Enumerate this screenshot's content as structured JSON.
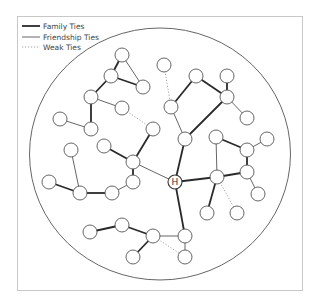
{
  "colors": {
    "frame": "#c8c8c8",
    "boundary": "#555555",
    "family": "#2a2a2a",
    "friendship": "#555555",
    "weak": "#9a9a9a",
    "node_fill": "#ffffff",
    "node_stroke": "#555555"
  },
  "legend": {
    "items": [
      {
        "label": "Family Ties",
        "style": "family"
      },
      {
        "label": "Friendship Ties",
        "style": "friendship"
      },
      {
        "label": "Weak Ties",
        "style": "weak"
      }
    ]
  },
  "center_node": {
    "id": "H",
    "label": "H"
  },
  "nodes": [
    {
      "id": "H",
      "x": 175,
      "y": 182
    },
    {
      "id": "n1",
      "x": 122,
      "y": 55
    },
    {
      "id": "n2",
      "x": 111,
      "y": 76
    },
    {
      "id": "n3",
      "x": 143,
      "y": 87
    },
    {
      "id": "n4",
      "x": 91,
      "y": 97
    },
    {
      "id": "n5",
      "x": 122,
      "y": 108
    },
    {
      "id": "n6",
      "x": 60,
      "y": 119
    },
    {
      "id": "n7",
      "x": 91,
      "y": 129
    },
    {
      "id": "n8",
      "x": 153,
      "y": 129
    },
    {
      "id": "n9",
      "x": 164,
      "y": 65
    },
    {
      "id": "n10",
      "x": 196,
      "y": 76
    },
    {
      "id": "n11",
      "x": 227,
      "y": 76
    },
    {
      "id": "n12",
      "x": 227,
      "y": 97
    },
    {
      "id": "n13",
      "x": 171,
      "y": 107
    },
    {
      "id": "n14",
      "x": 247,
      "y": 118
    },
    {
      "id": "n15",
      "x": 185,
      "y": 139
    },
    {
      "id": "n16",
      "x": 216,
      "y": 137
    },
    {
      "id": "n17",
      "x": 247,
      "y": 150
    },
    {
      "id": "n18",
      "x": 267,
      "y": 139
    },
    {
      "id": "n19",
      "x": 247,
      "y": 172
    },
    {
      "id": "n20",
      "x": 217,
      "y": 177
    },
    {
      "id": "n21",
      "x": 258,
      "y": 194
    },
    {
      "id": "n22",
      "x": 207,
      "y": 213
    },
    {
      "id": "n23",
      "x": 237,
      "y": 213
    },
    {
      "id": "n24",
      "x": 71,
      "y": 150
    },
    {
      "id": "n25",
      "x": 104,
      "y": 146
    },
    {
      "id": "n26",
      "x": 133,
      "y": 162
    },
    {
      "id": "n27",
      "x": 49,
      "y": 182
    },
    {
      "id": "n28",
      "x": 133,
      "y": 182
    },
    {
      "id": "n29",
      "x": 80,
      "y": 193
    },
    {
      "id": "n30",
      "x": 112,
      "y": 193
    },
    {
      "id": "n31",
      "x": 90,
      "y": 232
    },
    {
      "id": "n32",
      "x": 122,
      "y": 225
    },
    {
      "id": "n33",
      "x": 153,
      "y": 236
    },
    {
      "id": "n34",
      "x": 185,
      "y": 236
    },
    {
      "id": "n35",
      "x": 133,
      "y": 257
    },
    {
      "id": "n36",
      "x": 185,
      "y": 257
    }
  ],
  "edges": [
    {
      "from": "n1",
      "to": "n2",
      "type": "family"
    },
    {
      "from": "n1",
      "to": "n3",
      "type": "friendship"
    },
    {
      "from": "n2",
      "to": "n3",
      "type": "family"
    },
    {
      "from": "n2",
      "to": "n4",
      "type": "family"
    },
    {
      "from": "n4",
      "to": "n5",
      "type": "friendship"
    },
    {
      "from": "n4",
      "to": "n7",
      "type": "family"
    },
    {
      "from": "n7",
      "to": "n6",
      "type": "friendship"
    },
    {
      "from": "n5",
      "to": "n8",
      "type": "weak"
    },
    {
      "from": "n9",
      "to": "n13",
      "type": "weak"
    },
    {
      "from": "n13",
      "to": "n10",
      "type": "family"
    },
    {
      "from": "n10",
      "to": "n12",
      "type": "family"
    },
    {
      "from": "n11",
      "to": "n12",
      "type": "family"
    },
    {
      "from": "n12",
      "to": "n14",
      "type": "friendship"
    },
    {
      "from": "n12",
      "to": "n15",
      "type": "family"
    },
    {
      "from": "n13",
      "to": "n15",
      "type": "friendship"
    },
    {
      "from": "H",
      "to": "n15",
      "type": "family"
    },
    {
      "from": "n16",
      "to": "n17",
      "type": "family"
    },
    {
      "from": "n16",
      "to": "n20",
      "type": "friendship"
    },
    {
      "from": "n17",
      "to": "n18",
      "type": "friendship"
    },
    {
      "from": "n17",
      "to": "n19",
      "type": "family"
    },
    {
      "from": "n19",
      "to": "n20",
      "type": "family"
    },
    {
      "from": "n19",
      "to": "n21",
      "type": "friendship"
    },
    {
      "from": "H",
      "to": "n20",
      "type": "family"
    },
    {
      "from": "n20",
      "to": "n22",
      "type": "family"
    },
    {
      "from": "n20",
      "to": "n23",
      "type": "weak"
    },
    {
      "from": "n8",
      "to": "n26",
      "type": "family"
    },
    {
      "from": "n25",
      "to": "n26",
      "type": "family"
    },
    {
      "from": "n26",
      "to": "n28",
      "type": "family"
    },
    {
      "from": "n26",
      "to": "H",
      "type": "friendship"
    },
    {
      "from": "n28",
      "to": "n30",
      "type": "friendship"
    },
    {
      "from": "n30",
      "to": "n29",
      "type": "family"
    },
    {
      "from": "n29",
      "to": "n24",
      "type": "friendship"
    },
    {
      "from": "n29",
      "to": "n27",
      "type": "family"
    },
    {
      "from": "H",
      "to": "n34",
      "type": "family"
    },
    {
      "from": "n31",
      "to": "n32",
      "type": "family"
    },
    {
      "from": "n32",
      "to": "n33",
      "type": "family"
    },
    {
      "from": "n33",
      "to": "n34",
      "type": "friendship"
    },
    {
      "from": "n33",
      "to": "n35",
      "type": "family"
    },
    {
      "from": "n33",
      "to": "n36",
      "type": "weak"
    },
    {
      "from": "n34",
      "to": "n36",
      "type": "friendship"
    }
  ]
}
